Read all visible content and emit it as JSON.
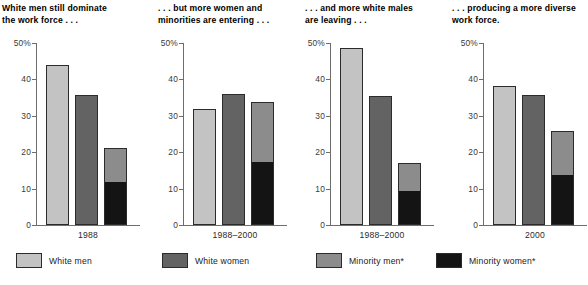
{
  "chart_data": {
    "type": "bar",
    "title": "",
    "subtitle": "",
    "xlabel": "",
    "ylabel": "",
    "ylim": [
      0,
      50
    ],
    "ytick_labels": [
      "50%",
      "40",
      "30",
      "20",
      "10",
      "0"
    ],
    "ytick_values": [
      50,
      40,
      30,
      20,
      10,
      0
    ],
    "grid": false,
    "legend_position": "bottom",
    "legend": [
      {
        "name": "White men",
        "color": "#c3c3c3"
      },
      {
        "name": "White women",
        "color": "#636363"
      },
      {
        "name": "Minority men*",
        "color": "#8c8c8c"
      },
      {
        "name": "Minority women*",
        "color": "#141414"
      }
    ],
    "categories": [
      "White men",
      "White women",
      "Minority men*",
      "Minority women*"
    ],
    "panels": [
      {
        "title": "White men still dominate\nthe work force . . .",
        "category": "1988",
        "bars": [
          {
            "series": "White men",
            "value": 44.0,
            "stack": [
              {
                "series": "White men",
                "value": 44.0
              }
            ]
          },
          {
            "series": "White women",
            "value": 35.7,
            "stack": [
              {
                "series": "White women",
                "value": 35.7
              }
            ]
          },
          {
            "series": "Minority",
            "value": 21.2,
            "stack": [
              {
                "series": "Minority women*",
                "value": 11.5
              },
              {
                "series": "Minority men*",
                "value": 9.7
              }
            ]
          }
        ]
      },
      {
        "title": ". . . but more women and\nminorities are entering . . .",
        "category": "1988–2000",
        "bars": [
          {
            "series": "White men",
            "value": 31.8,
            "stack": [
              {
                "series": "White men",
                "value": 31.8
              }
            ]
          },
          {
            "series": "White women",
            "value": 36.0,
            "stack": [
              {
                "series": "White women",
                "value": 36.0
              }
            ]
          },
          {
            "series": "Minority",
            "value": 33.7,
            "stack": [
              {
                "series": "Minority women*",
                "value": 17.0
              },
              {
                "series": "Minority men*",
                "value": 16.7
              }
            ]
          }
        ]
      },
      {
        "title": ". . . and more white males\nare leaving . . .",
        "category": "1988–2000",
        "bars": [
          {
            "series": "White men",
            "value": 48.6,
            "stack": [
              {
                "series": "White men",
                "value": 48.6
              }
            ]
          },
          {
            "series": "White women",
            "value": 35.4,
            "stack": [
              {
                "series": "White women",
                "value": 35.4
              }
            ]
          },
          {
            "series": "Minority",
            "value": 17.0,
            "stack": [
              {
                "series": "Minority women*",
                "value": 9.0
              },
              {
                "series": "Minority men*",
                "value": 8.0
              }
            ]
          }
        ]
      },
      {
        "title": ". . . producing a more diverse\nwork force.",
        "category": "2000",
        "bars": [
          {
            "series": "White men",
            "value": 38.3,
            "stack": [
              {
                "series": "White men",
                "value": 38.3
              }
            ]
          },
          {
            "series": "White women",
            "value": 35.8,
            "stack": [
              {
                "series": "White women",
                "value": 35.8
              }
            ]
          },
          {
            "series": "Minority",
            "value": 25.9,
            "stack": [
              {
                "series": "Minority women*",
                "value": 13.6
              },
              {
                "series": "Minority men*",
                "value": 12.3
              }
            ]
          }
        ]
      }
    ]
  },
  "panels": [
    {
      "title": "White men still dominate\nthe work force . . .",
      "category": "1988",
      "ticks": [
        "50%",
        "40",
        "30",
        "20",
        "10",
        "0"
      ]
    },
    {
      "title": ". . . but more women and\nminorities are entering . . .",
      "category": "1988–2000",
      "ticks": [
        "50%",
        "40",
        "30",
        "20",
        "10",
        "0"
      ]
    },
    {
      "title": ". . . and more white males\nare leaving . . .",
      "category": "1988–2000",
      "ticks": [
        "50%",
        "40",
        "30",
        "20",
        "10",
        "0"
      ]
    },
    {
      "title": ". . . producing a more diverse\nwork force.",
      "category": "2000",
      "ticks": [
        "50%",
        "40",
        "30",
        "20",
        "10",
        "0"
      ]
    }
  ],
  "legend": {
    "items": [
      {
        "label": "White men"
      },
      {
        "label": "White women"
      },
      {
        "label": "Minority men*"
      },
      {
        "label": "Minority women*"
      }
    ]
  }
}
